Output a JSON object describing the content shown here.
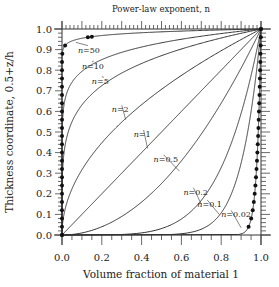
{
  "chart_data": {
    "type": "line",
    "title": "Power-law exponent, n",
    "xlabel": "Volume fraction of material 1",
    "ylabel": "Thickness coordinate, 0.5+z/h",
    "xlim": [
      0,
      1
    ],
    "ylim": [
      0,
      1
    ],
    "x_ticks": [
      "0.0",
      "0.2",
      "0.4",
      "0.6",
      "0.8",
      "1.0"
    ],
    "y_ticks": [
      "0.0",
      "0.1",
      "0.2",
      "0.3",
      "0.4",
      "0.5",
      "0.6",
      "0.7",
      "0.8",
      "0.9",
      "1.0"
    ],
    "grid": false,
    "relation": "volume_fraction = (0.5 + z/h)^n",
    "series": [
      {
        "name": "n=50",
        "n": 50,
        "label": "n=50",
        "markers": true
      },
      {
        "name": "n=10",
        "n": 10,
        "label": "n=10",
        "markers": false
      },
      {
        "name": "n=5",
        "n": 5,
        "label": "n=5",
        "markers": false
      },
      {
        "name": "n=2",
        "n": 2,
        "label": "n=2",
        "markers": false
      },
      {
        "name": "n=1",
        "n": 1,
        "label": "n=1",
        "markers": false
      },
      {
        "name": "n=0.5",
        "n": 0.5,
        "label": "n=0.5",
        "markers": false
      },
      {
        "name": "n=0.2",
        "n": 0.2,
        "label": "n=0.2",
        "markers": false
      },
      {
        "name": "n=0.1",
        "n": 0.1,
        "label": "n=0.1",
        "markers": false
      },
      {
        "name": "n=0.02",
        "n": 0.02,
        "label": "n=0.02",
        "markers": true
      }
    ]
  },
  "labels": {
    "title": "Power-law exponent, n",
    "xlabel": "Volume fraction of material 1",
    "ylabel": "Thickness coordinate, 0.5+z/h"
  }
}
